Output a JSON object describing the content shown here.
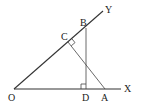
{
  "diagram": {
    "type": "geometry",
    "points": {
      "O": {
        "label": "O",
        "x": 14,
        "y": 89
      },
      "X": {
        "label": "X",
        "x": 120,
        "y": 89
      },
      "Y": {
        "label": "Y",
        "x": 103,
        "y": 11
      },
      "B": {
        "label": "B",
        "x": 86,
        "y": 28
      },
      "C": {
        "label": "C",
        "x": 68,
        "y": 42
      },
      "D": {
        "label": "D",
        "x": 86,
        "y": 89
      },
      "A": {
        "label": "A",
        "x": 105,
        "y": 89
      }
    },
    "segments": [
      {
        "from": "O",
        "to": "X",
        "name": "ray-ox"
      },
      {
        "from": "O",
        "to": "Y",
        "name": "ray-oy"
      },
      {
        "from": "B",
        "to": "D",
        "name": "segment-bd"
      },
      {
        "from": "C",
        "to": "A",
        "name": "segment-ca"
      }
    ],
    "right_angles": [
      {
        "at": "D",
        "name": "right-angle-d"
      },
      {
        "at": "C",
        "name": "right-angle-c"
      }
    ]
  }
}
